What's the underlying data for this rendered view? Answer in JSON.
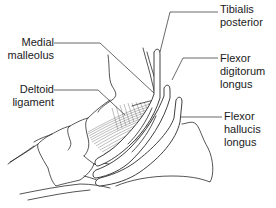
{
  "figure": {
    "type": "anatomical line drawing",
    "colors": {
      "line": "#2a2a2a",
      "background": "#ffffff",
      "text": "#1a1a1a"
    }
  },
  "labels": {
    "tibialis_posterior": {
      "line1": "Tibialis",
      "line2": "posterior"
    },
    "medial_malleolus": {
      "line1": "Medial",
      "line2": "malleolus"
    },
    "flexor_digitorum_longus": {
      "line1": "Flexor",
      "line2": "digitorum",
      "line3": "longus"
    },
    "deltoid_ligament": {
      "line1": "Deltoid",
      "line2": "ligament"
    },
    "flexor_hallucis_longus": {
      "line1": "Flexor",
      "line2": "hallucis",
      "line3": "longus"
    }
  }
}
